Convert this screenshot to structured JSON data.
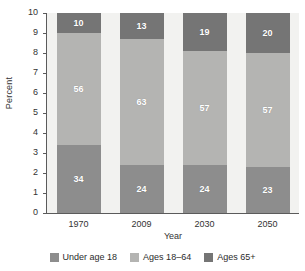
{
  "chart_data": {
    "type": "bar",
    "subtype": "stacked-percent",
    "title": "",
    "xlabel": "Year",
    "ylabel": "Percent",
    "categories": [
      "1970",
      "2009",
      "2030",
      "2050"
    ],
    "ylim": [
      0,
      10
    ],
    "yticks": [
      "0",
      "1",
      "2",
      "3",
      "4",
      "5",
      "6",
      "7",
      "8",
      "9",
      "10"
    ],
    "grid": false,
    "legend_position": "bottom",
    "series": [
      {
        "name": "Under age 18",
        "color": "#8d8d8d",
        "values": [
          34,
          24,
          24,
          23
        ]
      },
      {
        "name": "Ages 18–64",
        "color": "#b4b4b2",
        "values": [
          56,
          63,
          57,
          57
        ]
      },
      {
        "name": "Ages 65+",
        "color": "#757575",
        "values": [
          10,
          13,
          19,
          20
        ]
      }
    ]
  },
  "colors": {
    "plot_background": "#f2f2f0",
    "axis": "#5b5b5b",
    "text": "#2b2b2b",
    "value_label": "#ffffff"
  }
}
